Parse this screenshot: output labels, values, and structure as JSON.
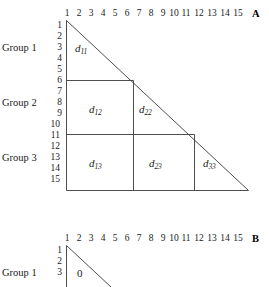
{
  "figure": {
    "panels": [
      {
        "id": "A",
        "letter": "A",
        "column_header_values": [
          "1",
          "2",
          "3",
          "4",
          "5",
          "6",
          "7",
          "8",
          "9",
          "10",
          "11",
          "12",
          "13",
          "14",
          "15"
        ],
        "row_header_values": [
          "1",
          "2",
          "3",
          "4",
          "5",
          "6",
          "7",
          "8",
          "9",
          "10",
          "11",
          "12",
          "13",
          "14",
          "15"
        ],
        "group_labels": [
          "Group 1",
          "Group 2",
          "Group 3"
        ],
        "block_labels": [
          {
            "base": "d",
            "sub": "11"
          },
          {
            "base": "d",
            "sub": "12"
          },
          {
            "base": "d",
            "sub": "22"
          },
          {
            "base": "d",
            "sub": "13"
          },
          {
            "base": "d",
            "sub": "23"
          },
          {
            "base": "d",
            "sub": "33"
          }
        ]
      },
      {
        "id": "B",
        "letter": "B",
        "column_header_values": [
          "1",
          "2",
          "3",
          "4",
          "5",
          "6",
          "7",
          "8",
          "9",
          "10",
          "11",
          "12",
          "13",
          "14",
          "15"
        ],
        "row_header_values": [
          "1",
          "2",
          "3"
        ],
        "group_labels": [
          "Group 1"
        ],
        "zero_label": "0"
      }
    ]
  },
  "panel_a": {
    "letter": "A",
    "cols": {
      "c1": "1",
      "c2": "2",
      "c3": "3",
      "c4": "4",
      "c5": "5",
      "c6": "6",
      "c7": "7",
      "c8": "8",
      "c9": "9",
      "c10": "10",
      "c11": "11",
      "c12": "12",
      "c13": "13",
      "c14": "14",
      "c15": "15"
    },
    "rows": {
      "r1": "1",
      "r2": "2",
      "r3": "3",
      "r4": "4",
      "r5": "5",
      "r6": "6",
      "r7": "7",
      "r8": "8",
      "r9": "9",
      "r10": "10",
      "r11": "11",
      "r12": "12",
      "r13": "13",
      "r14": "14",
      "r15": "15"
    },
    "groups": {
      "g1": "Group 1",
      "g2": "Group 2",
      "g3": "Group 3"
    },
    "blocks": {
      "d11_base": "d",
      "d11_sub": "11",
      "d12_base": "d",
      "d12_sub": "12",
      "d22_base": "d",
      "d22_sub": "22",
      "d13_base": "d",
      "d13_sub": "13",
      "d23_base": "d",
      "d23_sub": "23",
      "d33_base": "d",
      "d33_sub": "33"
    }
  },
  "panel_b": {
    "letter": "B",
    "cols": {
      "c1": "1",
      "c2": "2",
      "c3": "3",
      "c4": "4",
      "c5": "5",
      "c6": "6",
      "c7": "7",
      "c8": "8",
      "c9": "9",
      "c10": "10",
      "c11": "11",
      "c12": "12",
      "c13": "13",
      "c14": "14",
      "c15": "15"
    },
    "rows": {
      "r1": "1",
      "r2": "2",
      "r3": "3"
    },
    "groups": {
      "g1": "Group 1"
    },
    "zero": "0"
  },
  "style": {
    "line_color": "#3a3a3a",
    "text_color": "#1a1a1a",
    "background": "#ffffff"
  }
}
